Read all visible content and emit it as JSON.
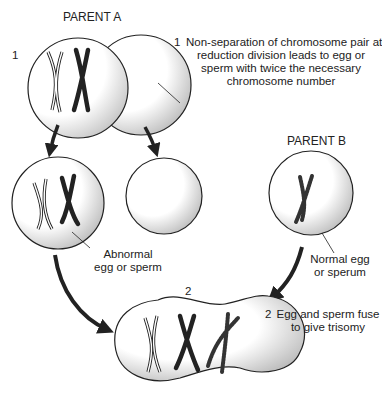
{
  "diagram": {
    "parent_a_label": "PARENT A",
    "parent_b_label": "PARENT B",
    "step1_number": "1",
    "step1_caption_number": "1",
    "step1_caption": [
      "Non-separation of chromosome pair at",
      "reduction division leads to egg or",
      "sperm with twice the necessary",
      "chromosome number"
    ],
    "abnormal_label": [
      "Abnormal",
      "egg or sperm"
    ],
    "normal_label": [
      "Normal egg",
      "or sperum"
    ],
    "step2_number": "2",
    "step2_caption_number": "2",
    "step2_caption": [
      "Egg and sperm fuse",
      "to give trisomy"
    ],
    "colors": {
      "line": "#222222",
      "stipple": "#555555",
      "background": "#ffffff"
    }
  }
}
